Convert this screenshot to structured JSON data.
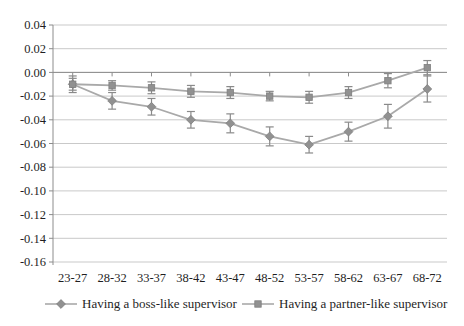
{
  "chart_data": {
    "type": "line",
    "title": "",
    "categories": [
      "23-27",
      "28-32",
      "33-37",
      "38-42",
      "43-47",
      "48-52",
      "53-57",
      "58-62",
      "63-67",
      "68-72"
    ],
    "series": [
      {
        "name": "Having a boss-like supervisor",
        "marker": "diamond",
        "values": [
          -0.01,
          -0.024,
          -0.029,
          -0.04,
          -0.043,
          -0.054,
          -0.061,
          -0.05,
          -0.037,
          -0.014
        ],
        "errors": [
          0.007,
          0.007,
          0.007,
          0.007,
          0.008,
          0.008,
          0.007,
          0.008,
          0.01,
          0.011
        ]
      },
      {
        "name": "Having a partner-like supervisor",
        "marker": "square",
        "values": [
          -0.01,
          -0.011,
          -0.013,
          -0.016,
          -0.017,
          -0.02,
          -0.021,
          -0.017,
          -0.007,
          0.004
        ],
        "errors": [
          0.005,
          0.004,
          0.005,
          0.005,
          0.005,
          0.004,
          0.005,
          0.005,
          0.006,
          0.006
        ]
      }
    ],
    "y_ticks": [
      "0.04",
      "0.02",
      "0.00",
      "-0.02",
      "-0.04",
      "-0.06",
      "-0.08",
      "-0.10",
      "-0.12",
      "-0.14",
      "-0.16"
    ],
    "ylim": [
      -0.16,
      0.04
    ],
    "xlabel": "",
    "ylabel": "",
    "grid": "horizontal",
    "legend_position": "bottom",
    "colors": {
      "series_line": "#a9a9a9",
      "marker_fill": "#919191",
      "marker_stroke": "#7f7f7f",
      "error_bar": "#8a8a8a",
      "gridline": "#c9c9c9",
      "axis": "#8c8c8c",
      "text": "#1f1f1f",
      "background": "#ffffff"
    }
  }
}
